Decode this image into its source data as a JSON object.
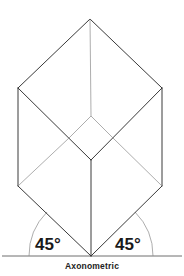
{
  "diagram": {
    "caption": "Axonometric",
    "angles": [
      {
        "side": "left",
        "label": "45°"
      },
      {
        "side": "right",
        "label": "45°"
      }
    ],
    "shape": "cube",
    "projection": "axonometric",
    "colors": {
      "line": "#3a3a3a",
      "background": "#ffffff"
    }
  }
}
